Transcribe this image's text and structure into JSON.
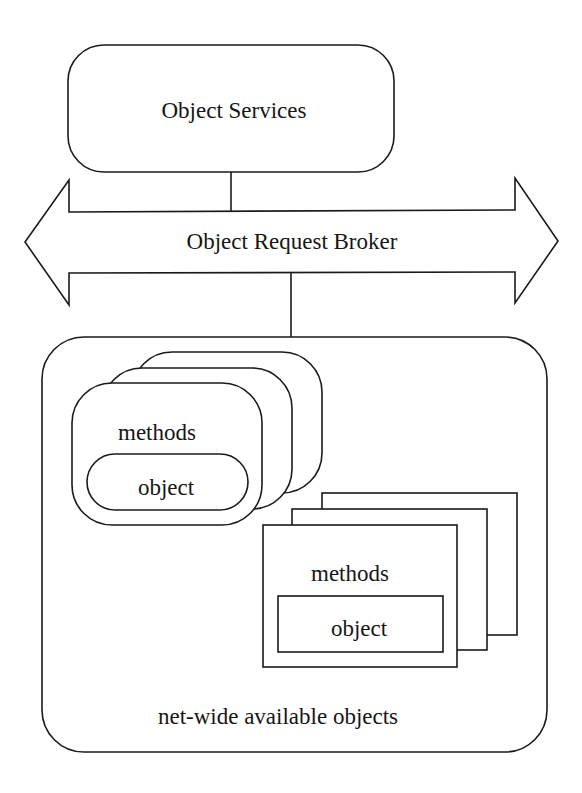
{
  "diagram": {
    "colors": {
      "stroke": "#1a1a1a",
      "fill": "#ffffff",
      "text": "#161616"
    },
    "object_services": {
      "label": "Object Services"
    },
    "orb": {
      "label": "Object Request Broker"
    },
    "container": {
      "label": "net-wide available objects"
    },
    "rounded_stack": {
      "methods_label": "methods",
      "object_label": "object",
      "layers": 3
    },
    "rect_stack": {
      "methods_label": "methods",
      "object_label": "object",
      "layers": 3
    }
  }
}
